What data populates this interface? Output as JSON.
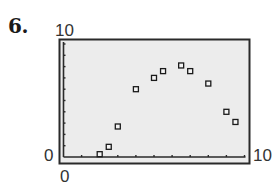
{
  "problem": {
    "number": "6."
  },
  "window": {
    "xmin": "0",
    "xmax": "10",
    "ymin": "0",
    "ymax": "10"
  },
  "colors": {
    "frame": "#2a2a2a",
    "screen": "#ececec",
    "marker": "#1a1a1a"
  },
  "chart_data": {
    "type": "scatter",
    "title": "",
    "xlabel": "",
    "ylabel": "",
    "xlim": [
      0,
      10
    ],
    "ylim": [
      0,
      10
    ],
    "x_ticks_every": 1,
    "y_ticks_every": 1,
    "grid": false,
    "marker": "hollow-square",
    "series": [
      {
        "name": "data",
        "x": [
          2,
          2.5,
          3,
          4,
          5,
          5.5,
          6.5,
          7,
          8,
          9,
          9.5
        ],
        "y": [
          0.25,
          0.9,
          2.7,
          6,
          7,
          7.6,
          8.1,
          7.6,
          6.5,
          4,
          3.1
        ]
      }
    ],
    "axis_labels": {
      "x_min": "0",
      "x_max": "10",
      "y_min": "0",
      "y_max": "10"
    }
  }
}
